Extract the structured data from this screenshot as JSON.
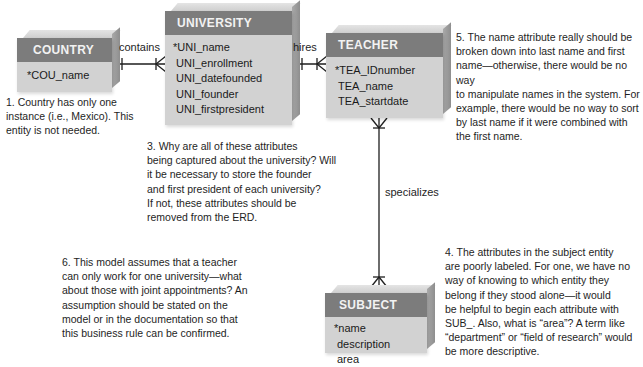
{
  "entities": {
    "country": {
      "title": "COUNTRY",
      "attributes": [
        "*COU_name"
      ]
    },
    "university": {
      "title": "UNIVERSITY",
      "attributes": [
        "*UNI_name",
        "UNI_enrollment",
        "UNI_datefounded",
        "UNI_founder",
        "UNI_firstpresident"
      ]
    },
    "teacher": {
      "title": "TEACHER",
      "attributes": [
        "*TEA_IDnumber",
        "TEA_name",
        "TEA_startdate"
      ]
    },
    "subject": {
      "title": "SUBJECT",
      "attributes": [
        "*name",
        "description",
        "area"
      ]
    }
  },
  "relationships": {
    "contains": "contains",
    "hires": "hires",
    "specializes": "specializes"
  },
  "notes": {
    "n1": [
      "1. Country has only one",
      "instance (i.e., Mexico). This",
      "entity is not needed."
    ],
    "n3": [
      "3. Why are all of these attributes",
      "being captured about the university? Will",
      "it be  necessary to store the founder",
      "and first president of each university?",
      "If not, these attributes should be",
      "removed from the ERD."
    ],
    "n4": [
      "4. The attributes in the subject entity",
      "are poorly labeled. For one, we have no",
      "way of knowing to which entity they",
      "belong if they stood alone—it would",
      "be helpful to begin each attribute with",
      "SUB_. Also, what is “area”? A term like",
      "“department” or “field of research” would",
      "be more descriptive."
    ],
    "n5": [
      "5. The name attribute really should be",
      "broken down into last name and first",
      "name—otherwise, there would be no way",
      "to manipulate names in the system. For",
      "example, there would be no way to sort",
      "by last name if it were combined with",
      "the first name."
    ],
    "n6": [
      "6. This model assumes that a teacher",
      "can only work for one university—what",
      "about those with joint appointments? An",
      "assumption should be stated on the",
      "model or in the documentation so that",
      "this business rule can be confirmed."
    ]
  },
  "colors": {
    "header": "#7c7c7c",
    "body": "#d2d2d2",
    "line": "#1e1e1e"
  }
}
